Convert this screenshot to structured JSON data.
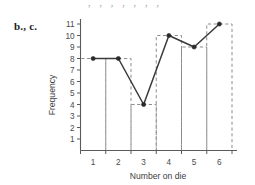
{
  "figure": {
    "panel_label": "b., c.",
    "top_artifact_text": "  ,  ,  ,  ,     ,  ,  ,"
  },
  "chart_data": {
    "type": "line",
    "title": "",
    "subtitle": "",
    "xlabel": "Number on die",
    "ylabel": "Frequency",
    "categories": [
      "1",
      "2",
      "3",
      "4",
      "5",
      "6"
    ],
    "x": [
      1,
      2,
      3,
      4,
      5,
      6
    ],
    "values": [
      8,
      8,
      4,
      10,
      9,
      11
    ],
    "series": [
      {
        "name": "Frequency polygon",
        "values": [
          8,
          8,
          4,
          10,
          9,
          11
        ]
      }
    ],
    "overlay": {
      "type": "bar",
      "style": "dashed-outline",
      "bin_edges": [
        0.5,
        1.5,
        2.5,
        3.5,
        4.5,
        5.5,
        6.5
      ],
      "values": [
        8,
        8,
        4,
        10,
        9,
        11
      ]
    },
    "xlim": [
      0.5,
      6.5
    ],
    "ylim": [
      0,
      11.6
    ],
    "ytick_labels": [
      "1",
      "2",
      "3",
      "4",
      "5",
      "6",
      "7",
      "8",
      "9",
      "10",
      "11"
    ],
    "yticks": [
      1,
      2,
      3,
      4,
      5,
      6,
      7,
      8,
      9,
      10,
      11
    ],
    "xtick_labels": [
      "1",
      "2",
      "3",
      "4",
      "5",
      "6"
    ],
    "xticks": [
      1,
      2,
      3,
      4,
      5,
      6
    ],
    "xtick_mark_positions": [
      0.5,
      1.5,
      2.5,
      3.5,
      4.5,
      5.5,
      6.5
    ],
    "grid": false,
    "legend": null,
    "colors": {
      "line": "#3a3a3a",
      "marker": "#2a2a2a",
      "bar_outline": "#8c8c8c",
      "axis": "#5a5a5a",
      "background": "#ffffff"
    }
  }
}
